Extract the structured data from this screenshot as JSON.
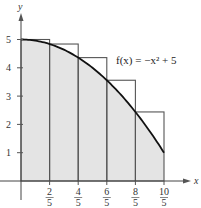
{
  "chart_data": {
    "type": "bar",
    "subtype": "riemann-sum-upper-rectangles-with-curve",
    "title": "",
    "xlabel": "x",
    "ylabel": "y",
    "function_label": "f(x) = −x² + 5",
    "function": "-x^2 + 5",
    "xlim": [
      0,
      2
    ],
    "ylim": [
      0,
      5
    ],
    "x_ticks": [
      {
        "value": 0.4,
        "num": "2",
        "den": "5"
      },
      {
        "value": 0.8,
        "num": "4",
        "den": "5"
      },
      {
        "value": 1.2,
        "num": "6",
        "den": "5"
      },
      {
        "value": 1.6,
        "num": "8",
        "den": "5"
      },
      {
        "value": 2.0,
        "num": "10",
        "den": "5"
      }
    ],
    "y_ticks": [
      1,
      2,
      3,
      4,
      5
    ],
    "categories": [
      "[0, 2/5]",
      "[2/5, 4/5]",
      "[4/5, 6/5]",
      "[6/5, 8/5]",
      "[8/5, 2]"
    ],
    "rectangles": [
      {
        "x0": 0.0,
        "x1": 0.4,
        "height": 5.0
      },
      {
        "x0": 0.4,
        "x1": 0.8,
        "height": 4.84
      },
      {
        "x0": 0.8,
        "x1": 1.2,
        "height": 4.36
      },
      {
        "x0": 1.2,
        "x1": 1.6,
        "height": 3.56
      },
      {
        "x0": 1.6,
        "x1": 2.0,
        "height": 2.44
      }
    ],
    "values": [
      5.0,
      4.84,
      4.36,
      3.56,
      2.44
    ],
    "grid": false,
    "colors": {
      "fill": "#e4e4e4",
      "lines": "#555555",
      "curve": "#111111",
      "axes": "#444444"
    }
  }
}
